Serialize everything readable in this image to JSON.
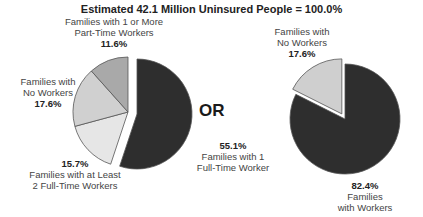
{
  "title": "Estimated 42.1 Million Uninsured People = 100.0%",
  "separator": "OR",
  "chart_data": [
    {
      "type": "pie",
      "title": "Estimated 42.1 Million Uninsured People = 100.0%",
      "categories": [
        "Families with 1 Full-Time Worker",
        "Families with at Least 2 Full-Time Workers",
        "Families with No Workers",
        "Families with 1 or More Part-Time Workers"
      ],
      "values": [
        55.1,
        15.7,
        17.6,
        11.6
      ],
      "colors": [
        "#2e2e2e",
        "#e6e6e6",
        "#d0d0d0",
        "#a9a9a9"
      ],
      "exploded": "non-full-time-worker group"
    },
    {
      "type": "pie",
      "categories": [
        "Families with Workers",
        "Families with No Workers"
      ],
      "values": [
        82.4,
        17.6
      ],
      "colors": [
        "#2e2e2e",
        "#cfcfcf"
      ],
      "exploded": "Families with No Workers"
    }
  ],
  "labels": {
    "left": {
      "part_time": {
        "line1": "Families with 1 or More",
        "line2": "Part-Time Workers",
        "pct": "11.6%"
      },
      "no_workers": {
        "line1": "Families with",
        "line2": "No Workers",
        "pct": "17.6%"
      },
      "two_full": {
        "pct": "15.7%",
        "line1": "Families with at Least",
        "line2": "2 Full-Time Workers"
      },
      "one_full": {
        "pct": "55.1%",
        "line1": "Families with 1",
        "line2": "Full-Time Worker"
      }
    },
    "right": {
      "no_workers": {
        "line1": "Families with",
        "line2": "No Workers",
        "pct": "17.6%"
      },
      "workers": {
        "pct": "82.4%",
        "line1": "Families",
        "line2": "with Workers"
      }
    }
  }
}
